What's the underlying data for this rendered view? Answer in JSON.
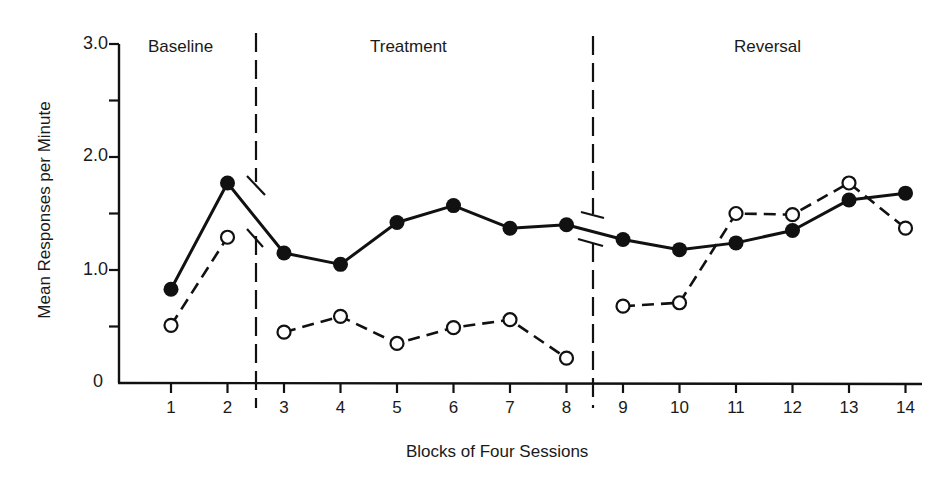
{
  "chart_data": {
    "type": "line",
    "title": "",
    "xlabel": "Blocks of Four Sessions",
    "ylabel": "Mean Responses per Minute",
    "x": [
      1,
      2,
      3,
      4,
      5,
      6,
      7,
      8,
      9,
      10,
      11,
      12,
      13,
      14
    ],
    "x_tick_labels": [
      "1",
      "2",
      "3",
      "4",
      "5",
      "6",
      "7",
      "8",
      "9",
      "10",
      "11",
      "12",
      "13",
      "14"
    ],
    "y_tick_labels": [
      {
        "value": 3.0,
        "label": "3.0"
      },
      {
        "value": 2.0,
        "label": "2.0"
      },
      {
        "value": 1.0,
        "label": "1.0"
      },
      {
        "value": 0,
        "label": "0"
      }
    ],
    "y_minor_ticks": [
      0.5,
      1.5,
      2.5
    ],
    "ylim": [
      0,
      3.0
    ],
    "grid": false,
    "legend": null,
    "phases": [
      {
        "label": "Baseline",
        "blocks": [
          1,
          2
        ]
      },
      {
        "label": "Treatment",
        "blocks": [
          3,
          8
        ]
      },
      {
        "label": "Reversal",
        "blocks": [
          9,
          14
        ]
      }
    ],
    "phase_change_lines": [
      2.5,
      8.5
    ],
    "series": [
      {
        "name": "Filled circles (solid line)",
        "marker": "filled-circle",
        "line_style": "solid",
        "values": [
          0.83,
          1.77,
          1.15,
          1.05,
          1.42,
          1.57,
          1.37,
          1.4,
          1.27,
          1.18,
          1.24,
          1.35,
          1.62,
          1.68
        ],
        "segments": [
          [
            1,
            14
          ]
        ]
      },
      {
        "name": "Open circles (dashed line)",
        "marker": "open-circle",
        "line_style": "dashed",
        "values": [
          0.51,
          1.29,
          0.45,
          0.59,
          0.35,
          0.49,
          0.56,
          0.22,
          0.68,
          0.71,
          1.5,
          1.49,
          1.77,
          1.37
        ],
        "segments": [
          [
            1,
            2
          ],
          [
            3,
            8
          ],
          [
            9,
            14
          ]
        ]
      }
    ]
  },
  "labels": {
    "phase_baseline": "Baseline",
    "phase_treatment": "Treatment",
    "phase_reversal": "Reversal",
    "xlabel": "Blocks of Four Sessions",
    "ylabel": "Mean Responses per Minute",
    "ytick_3": "3.0",
    "ytick_2": "2.0",
    "ytick_1": "1.0",
    "ytick_0": "0"
  }
}
